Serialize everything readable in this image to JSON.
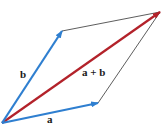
{
  "diagram": {
    "type": "vector-parallelogram",
    "colors": {
      "vector": "#2f7fd0",
      "sum": "#b3222a",
      "guide": "#333333"
    },
    "points": {
      "origin": [
        2,
        123
      ],
      "a_tip": [
        98,
        103
      ],
      "b_tip": [
        62,
        31
      ],
      "sum_tip": [
        160,
        12
      ]
    },
    "labels": {
      "a": "a",
      "b": "b",
      "sum": "a + b"
    }
  }
}
